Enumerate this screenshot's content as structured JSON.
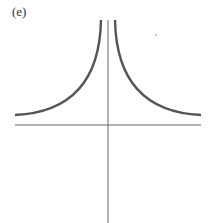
{
  "figure": {
    "label": "(e)",
    "colors": {
      "curve": "#555555",
      "axis": "#666666",
      "background": "#ffffff"
    },
    "axes": {
      "origin": [
        108,
        125
      ],
      "x_axis": {
        "x1": 15,
        "x2": 201,
        "y": 125
      },
      "y_axis": {
        "x": 108,
        "y1": 20,
        "y2": 223
      }
    },
    "curves": [
      {
        "name": "left-branch",
        "path": "M 101 20 C 100 70, 80 112, 15 115"
      },
      {
        "name": "right-branch",
        "path": "M 115 20 C 116 70, 136 112, 201 115"
      }
    ],
    "dot": {
      "cx": 156,
      "cy": 35,
      "r": 1
    }
  }
}
